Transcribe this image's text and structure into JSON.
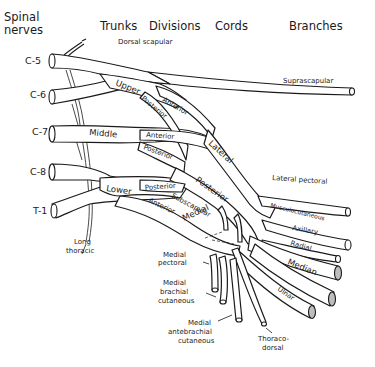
{
  "headers": {
    "spinal_nerves_1": "Spinal",
    "spinal_nerves_2": "nerves",
    "trunks": "Trunks",
    "divisions": "Divisions",
    "cords": "Cords",
    "branches": "Branches"
  },
  "roots": [
    "C-5",
    "C-6",
    "C-7",
    "C-8",
    "T-1"
  ],
  "trunks": {
    "upper": "Upper",
    "middle": "Middle",
    "lower": "Lower"
  },
  "divisions": {
    "upper_anterior": "Anterior",
    "upper_posterior": "Posterior",
    "middle_anterior": "Anterior",
    "middle_posterior": "Posterior",
    "lower_posterior": "Posterior",
    "lower_anterior": "Anterior"
  },
  "cords": {
    "lateral": "Lateral",
    "posterior": "Posterior",
    "medial": "Medial"
  },
  "branches": {
    "dorsal_scapular": "Dorsal scapular",
    "suprascapular": "Suprascapular",
    "lateral_pectoral": "Lateral pectoral",
    "musculocutaneous": "Musculocutaneous",
    "axillary": "Axillary",
    "radial": "Radial",
    "median": "Median",
    "ulnar": "Ulnar",
    "subscapular": "Subscapular",
    "long_thoracic_1": "Long",
    "long_thoracic_2": "thoracic",
    "medial_pectoral_1": "Medial",
    "medial_pectoral_2": "pectoral",
    "medial_brachial_1": "Medial",
    "medial_brachial_2": "brachial",
    "medial_brachial_3": "cutaneous",
    "medial_antebrachial_1": "Medial",
    "medial_antebrachial_2": "antebrachial",
    "medial_antebrachial_3": "cutaneous",
    "thoracodorsal_1": "Thoraco-",
    "thoracodorsal_2": "dorsal"
  }
}
